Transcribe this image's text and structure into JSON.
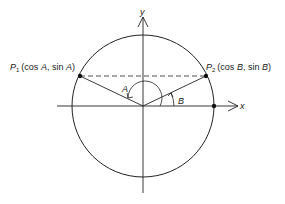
{
  "diagram": {
    "title": "",
    "axes": {
      "x_label": "x",
      "y_label": "y"
    },
    "points": [
      {
        "name": "P1",
        "letter": "P",
        "subscript": "1",
        "coords_text": "(cos A, sin A)",
        "pre": "(cos ",
        "angle": "A",
        "mid": ", sin ",
        "angle2": "A",
        "post": ")"
      },
      {
        "name": "P2",
        "letter": "P",
        "subscript": "2",
        "coords_text": "(cos B, sin B)",
        "pre": "(cos ",
        "angle": "B",
        "mid": ", sin ",
        "angle2": "B",
        "post": ")"
      }
    ],
    "angles": [
      {
        "label": "A"
      },
      {
        "label": "B"
      }
    ],
    "elements": [
      "unit circle",
      "x-axis",
      "y-axis",
      "dashed chord P1P2",
      "radius to P1",
      "radius to P2",
      "point at (1,0)"
    ],
    "colors": {
      "stroke": "#222222",
      "background": "#ffffff"
    }
  }
}
